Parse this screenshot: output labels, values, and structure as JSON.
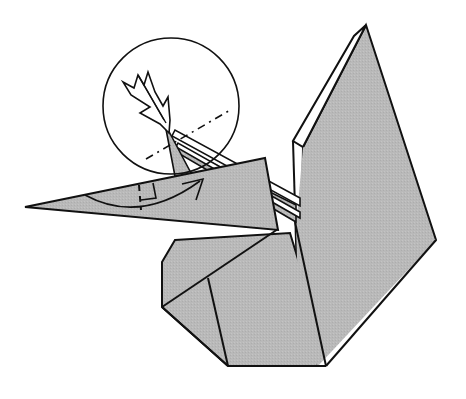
{
  "diagram": {
    "colors": {
      "background": "#ffffff",
      "paper": "#b8b8b8",
      "paper_light": "#c2c2c2",
      "edge": "#111111",
      "white_edge": "#ffffff"
    },
    "annotations": {
      "detail_circle": "magnified view of head",
      "push_arrow": "inside reverse fold arrow",
      "fold_arrow": "valley fold arrow",
      "fold_lines": "dash-dot fold line and dashed crease"
    }
  }
}
